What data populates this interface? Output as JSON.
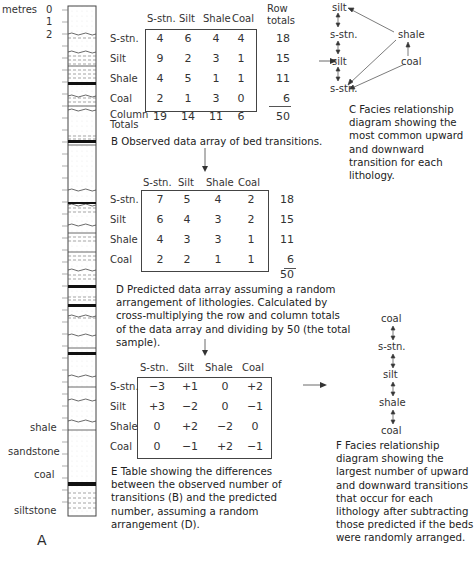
{
  "panel_a": {
    "scale_title": "metres",
    "scale_ticks": [
      "0",
      "1",
      "2"
    ],
    "lithology_labels": [
      "shale",
      "sandstone",
      "coal",
      "siltstone"
    ],
    "panel_letter": "A"
  },
  "panel_b": {
    "columns": [
      "S-stn.",
      "Silt",
      "Shale",
      "Coal"
    ],
    "row_totals_header": "Row totals",
    "rows": [
      {
        "label": "S-stn.",
        "values": [
          "4",
          "6",
          "4",
          "4"
        ],
        "total": "18"
      },
      {
        "label": "Silt",
        "values": [
          "9",
          "2",
          "3",
          "1"
        ],
        "total": "15"
      },
      {
        "label": "Shale",
        "values": [
          "4",
          "5",
          "1",
          "1"
        ],
        "total": "11"
      },
      {
        "label": "Coal",
        "values": [
          "2",
          "1",
          "3",
          "0"
        ],
        "total": "6"
      }
    ],
    "column_totals_label": "Column Totals",
    "column_totals": [
      "19",
      "14",
      "11",
      "6"
    ],
    "grand_total": "50",
    "caption": "B  Observed data array of bed transitions."
  },
  "panel_c": {
    "nodes": [
      "silt",
      "s-stn.",
      "silt",
      "s-stn.",
      "shale",
      "coal"
    ],
    "caption": "C  Facies relationship diagram showing the most common upward and downward transition for each lithology."
  },
  "panel_d": {
    "columns": [
      "S-stn.",
      "Silt",
      "Shale",
      "Coal"
    ],
    "rows": [
      {
        "label": "S-stn.",
        "values": [
          "7",
          "5",
          "4",
          "2"
        ],
        "total": "18"
      },
      {
        "label": "Silt",
        "values": [
          "6",
          "4",
          "3",
          "2"
        ],
        "total": "15"
      },
      {
        "label": "Shale",
        "values": [
          "4",
          "3",
          "3",
          "1"
        ],
        "total": "11"
      },
      {
        "label": "Coal",
        "values": [
          "2",
          "2",
          "1",
          "1"
        ],
        "total": "6"
      }
    ],
    "grand_total": "50",
    "caption": "D  Predicted data array assuming a random arrangement of lithologies. Calculated by cross-multiplying the row and column totals of the data array and dividing by 50 (the total sample)."
  },
  "panel_e": {
    "columns": [
      "S-stn.",
      "Silt",
      "Shale",
      "Coal"
    ],
    "rows": [
      {
        "label": "S-stn.",
        "values": [
          "−3",
          "+1",
          "0",
          "+2"
        ]
      },
      {
        "label": "Silt",
        "values": [
          "+3",
          "−2",
          "0",
          "−1"
        ]
      },
      {
        "label": "Shale",
        "values": [
          "0",
          "+2",
          "−2",
          "0"
        ]
      },
      {
        "label": "Coal",
        "values": [
          "0",
          "−1",
          "+2",
          "−1"
        ]
      }
    ],
    "caption": "E  Table showing the differences between the observed number of transitions (B) and the predicted number, assuming a random arrangement (D)."
  },
  "panel_f": {
    "nodes": [
      "coal",
      "s-stn.",
      "silt",
      "shale",
      "coal"
    ],
    "caption": "F  Facies relationship diagram showing the largest number of upward and downward transitions that occur for each lithology after subtracting those predicted if the beds were randomly arranged."
  }
}
